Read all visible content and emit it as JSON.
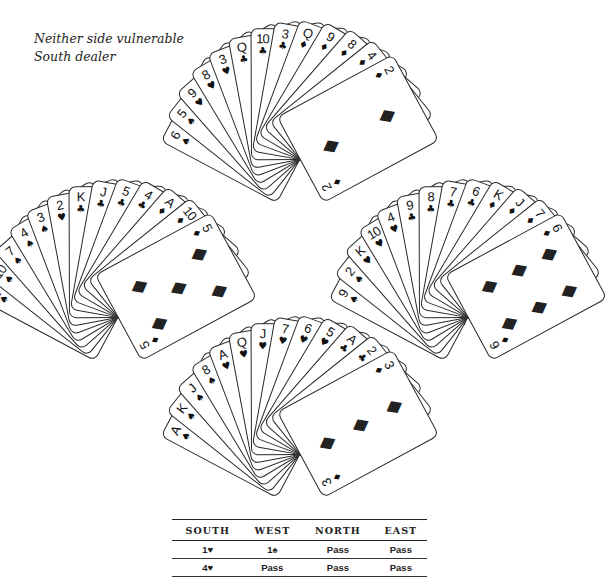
{
  "conditions": {
    "line1": "Neither side vulnerable",
    "line2": "South dealer"
  },
  "suits": {
    "S": "♠",
    "H": "♥",
    "C": "♣",
    "D": "♦"
  },
  "hands": {
    "north": {
      "label": "NORTH",
      "cards": [
        {
          "rank": "6",
          "suit": "♠"
        },
        {
          "rank": "5",
          "suit": "♠"
        },
        {
          "rank": "9",
          "suit": "♥"
        },
        {
          "rank": "8",
          "suit": "♥"
        },
        {
          "rank": "3",
          "suit": "♥"
        },
        {
          "rank": "Q",
          "suit": "♣"
        },
        {
          "rank": "10",
          "suit": "♣"
        },
        {
          "rank": "3",
          "suit": "♣"
        },
        {
          "rank": "Q",
          "suit": "♦"
        },
        {
          "rank": "9",
          "suit": "♦"
        },
        {
          "rank": "8",
          "suit": "♦"
        },
        {
          "rank": "4",
          "suit": "♦"
        },
        {
          "rank": "2",
          "suit": "♦"
        }
      ]
    },
    "west": {
      "label": "WEST",
      "cards": [
        {
          "rank": "Q",
          "suit": "♠"
        },
        {
          "rank": "10",
          "suit": "♠"
        },
        {
          "rank": "7",
          "suit": "♠"
        },
        {
          "rank": "4",
          "suit": "♠"
        },
        {
          "rank": "3",
          "suit": "♠"
        },
        {
          "rank": "2",
          "suit": "♥"
        },
        {
          "rank": "K",
          "suit": "♣"
        },
        {
          "rank": "J",
          "suit": "♣"
        },
        {
          "rank": "5",
          "suit": "♣"
        },
        {
          "rank": "4",
          "suit": "♣"
        },
        {
          "rank": "A",
          "suit": "♦"
        },
        {
          "rank": "10",
          "suit": "♦"
        },
        {
          "rank": "5",
          "suit": "♦"
        }
      ]
    },
    "east": {
      "label": "EAST",
      "cards": [
        {
          "rank": "9",
          "suit": "♠"
        },
        {
          "rank": "2",
          "suit": "♠"
        },
        {
          "rank": "K",
          "suit": "♥"
        },
        {
          "rank": "10",
          "suit": "♥"
        },
        {
          "rank": "4",
          "suit": "♥"
        },
        {
          "rank": "9",
          "suit": "♣"
        },
        {
          "rank": "8",
          "suit": "♣"
        },
        {
          "rank": "7",
          "suit": "♣"
        },
        {
          "rank": "6",
          "suit": "♣"
        },
        {
          "rank": "K",
          "suit": "♦"
        },
        {
          "rank": "J",
          "suit": "♦"
        },
        {
          "rank": "7",
          "suit": "♦"
        },
        {
          "rank": "6",
          "suit": "♦"
        }
      ]
    },
    "south": {
      "label": "SOUTH",
      "cards": [
        {
          "rank": "A",
          "suit": "♠"
        },
        {
          "rank": "K",
          "suit": "♠"
        },
        {
          "rank": "J",
          "suit": "♠"
        },
        {
          "rank": "8",
          "suit": "♠"
        },
        {
          "rank": "A",
          "suit": "♥"
        },
        {
          "rank": "Q",
          "suit": "♥"
        },
        {
          "rank": "J",
          "suit": "♥"
        },
        {
          "rank": "7",
          "suit": "♥"
        },
        {
          "rank": "6",
          "suit": "♥"
        },
        {
          "rank": "5",
          "suit": "♥"
        },
        {
          "rank": "A",
          "suit": "♣"
        },
        {
          "rank": "2",
          "suit": "♣"
        },
        {
          "rank": "3",
          "suit": "♦"
        }
      ]
    }
  },
  "auction": {
    "headers": [
      "SOUTH",
      "WEST",
      "NORTH",
      "EAST"
    ],
    "rows": [
      [
        "1♥",
        "1♠",
        "Pass",
        "Pass"
      ],
      [
        "4♥",
        "Pass",
        "Pass",
        "Pass"
      ]
    ]
  }
}
